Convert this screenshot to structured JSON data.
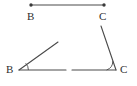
{
  "figure": {
    "width": 137,
    "height": 86,
    "background_color": "#ffffff",
    "stroke_color": "#4a4a4a",
    "label_color": "#2e2e2e",
    "point_marker_color": "#3a3a3a",
    "labels": {
      "segment_b": "B",
      "segment_c": "C",
      "angle_b": "B",
      "angle_c": "C"
    },
    "segment": {
      "name": "segment-bc",
      "endpoints": [
        {
          "label": "B",
          "x": 31,
          "y": 5
        },
        {
          "label": "C",
          "x": 104,
          "y": 5
        }
      ],
      "has_endpoint_dots": true
    },
    "angle_left": {
      "name": "angle-at-b",
      "vertex": {
        "label": "B",
        "x": 19,
        "y": 70
      },
      "rays": [
        {
          "name": "ray-b-upper",
          "to_x": 58,
          "to_y": 42
        },
        {
          "name": "ray-b-horizontal",
          "to_x": 66,
          "to_y": 70
        }
      ],
      "arc_marked": true,
      "opening": "right"
    },
    "angle_right": {
      "name": "angle-at-c",
      "vertex": {
        "label": "C",
        "x": 116,
        "y": 70
      },
      "rays": [
        {
          "name": "ray-c-upper",
          "to_x": 101,
          "to_y": 26
        },
        {
          "name": "ray-c-horizontal",
          "to_x": 72,
          "to_y": 70
        }
      ],
      "arc_marked": true,
      "opening": "left"
    }
  }
}
